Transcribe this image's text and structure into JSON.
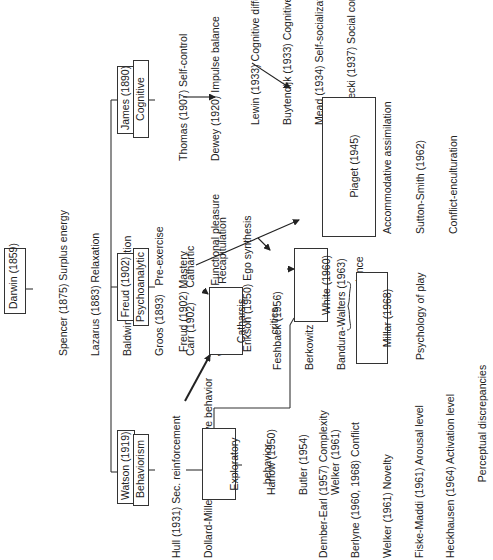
{
  "diagram": {
    "orientation": "rotated 90 degrees counter-clockwise",
    "root": {
      "label": "Darwin (1859)"
    },
    "darwin_followers": [
      "Spencer (1875) Surplus energy",
      "Lazarus (1883) Relaxation",
      "Baldwin (1895) Repetition",
      "Groos (1893)   Pre-exercise",
      "Carr (1902)     Cathartic",
      "Wundt (1913)   Recapitulation"
    ],
    "schools": {
      "behaviorism": {
        "line1": "Watson (1919)",
        "line2": "Behaviorism",
        "followers": [
          "Hull (1931) Sec. reinforcement",
          "Dollard-Miller (1941) Imitative behavior"
        ]
      },
      "psychoanalytic": {
        "line1": "Freud (1902)",
        "line2": "Psychoanalytic",
        "followers": [
          "Freud (1902) Mastery",
          "Buhler (1933) Functional pleasure",
          "Erikson (1950) Ego synthesis"
        ]
      },
      "cognitive": {
        "line1": "James (1890)",
        "line2": "Cognitive",
        "followers": [
          "Thomas (1907) Self-control",
          "Dewey (1920) Impulse balance"
        ]
      }
    },
    "cognitive_developers": [
      "Lewin (1933) Cognitive differentiation",
      "Buytendijk (1933) Cognitive differentiation",
      "Mead (1934) Self-socialization",
      "Znaniecki (1937) Social competence"
    ],
    "piaget": {
      "lines": [
        "Piaget (1945)",
        "Accommodative assimilation",
        "Sutton-Smith (1962)",
        "Conflict-enculturation"
      ]
    },
    "catharsis": {
      "line1": "Catharsis",
      "line2": "critics",
      "followers": [
        "Feshback (1956)",
        "Berkowitz (1961)",
        "Bandura-Walters (1963)"
      ]
    },
    "exploratory": {
      "line1": "Exploratory",
      "line2": "behavior",
      "followers": [
        "Harlow (1950)",
        "Butler (1954)",
        "Welker (1961)"
      ]
    },
    "arousal": [
      "Dember-Earl (1957) Complexity",
      "Berlyne (1960, 1968) Conflict",
      "Welker (1961) Novelty",
      "Fiske-Maddi (1961) Arousal level",
      "Heckhausen (1964) Activation level",
      "                          Perceptual discrepancies"
    ],
    "white": {
      "line1": "White (1960)",
      "line2": "competence"
    },
    "millar": {
      "line1": "Millar (1968)",
      "line2": "Psychology of play"
    }
  }
}
